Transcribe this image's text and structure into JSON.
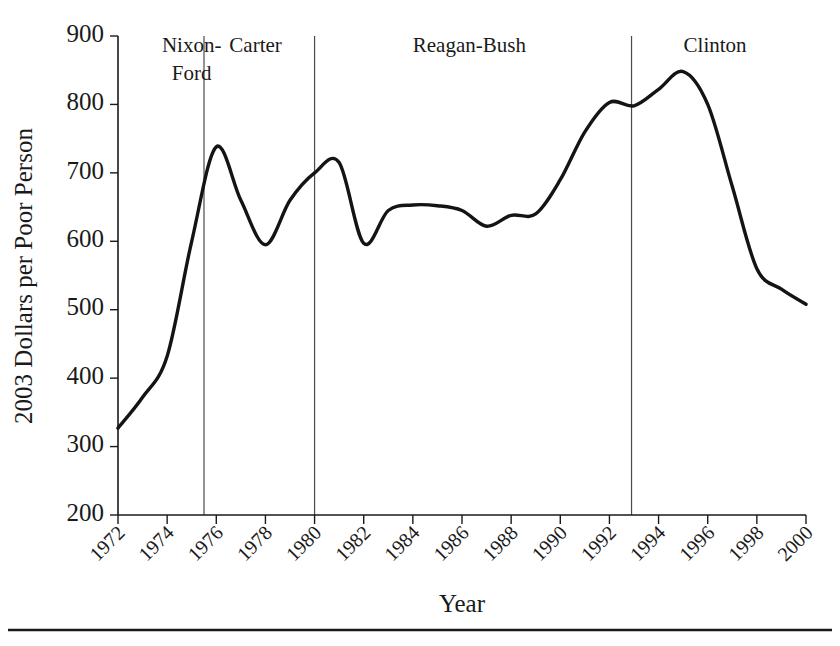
{
  "chart_data": {
    "type": "line",
    "title": "",
    "xlabel": "Year",
    "ylabel": "2003 Dollars per Poor Person",
    "xlim": [
      1972,
      2000
    ],
    "ylim": [
      200,
      900
    ],
    "grid": false,
    "legend": "none",
    "xticks": [
      1972,
      1974,
      1976,
      1978,
      1980,
      1982,
      1984,
      1986,
      1988,
      1990,
      1992,
      1994,
      1996,
      1998,
      2000
    ],
    "xtick_labels": [
      "1972",
      "1974",
      "1976",
      "1978",
      "1980",
      "1982",
      "1984",
      "1986",
      "1988",
      "1990",
      "1992",
      "1994",
      "1996",
      "1998",
      "2000"
    ],
    "yticks": [
      200,
      300,
      400,
      500,
      600,
      700,
      800,
      900
    ],
    "ytick_labels": [
      "200",
      "300",
      "400",
      "500",
      "600",
      "700",
      "800",
      "900"
    ],
    "series": [
      {
        "name": "Real spending per poor person",
        "x": [
          1972,
          1973,
          1974,
          1975,
          1976,
          1977,
          1978,
          1979,
          1980,
          1981,
          1982,
          1983,
          1984,
          1985,
          1986,
          1987,
          1988,
          1989,
          1990,
          1991,
          1992,
          1993,
          1994,
          1995,
          1996,
          1997,
          1998,
          1999,
          2000
        ],
        "values": [
          327,
          372,
          432,
          600,
          738,
          660,
          595,
          660,
          700,
          715,
          597,
          645,
          653,
          652,
          645,
          622,
          638,
          640,
          690,
          760,
          803,
          798,
          822,
          848,
          800,
          680,
          560,
          530,
          508
        ]
      }
    ],
    "annotations": [
      {
        "name": "era-nixon-ford",
        "label": "Nixon-Ford",
        "label_lines": [
          "Nixon-",
          "Ford"
        ],
        "x_center": 1975.0,
        "divider_x": null
      },
      {
        "name": "era-carter",
        "label": "Carter",
        "label_lines": [
          "Carter"
        ],
        "x_center": 1977.6,
        "divider_x": 1975.5
      },
      {
        "name": "era-reagan-bush",
        "label": "Reagan-Bush",
        "label_lines": [
          "Reagan-Bush"
        ],
        "x_center": 1986.3,
        "divider_x": 1980.0
      },
      {
        "name": "era-clinton",
        "label": "Clinton",
        "label_lines": [
          "Clinton"
        ],
        "x_center": 1996.3,
        "divider_x": 1992.9
      }
    ],
    "colors": {
      "line": "#141414",
      "axis": "#1a1a1a",
      "divider": "#4a4a4a",
      "background": "#ffffff"
    }
  }
}
